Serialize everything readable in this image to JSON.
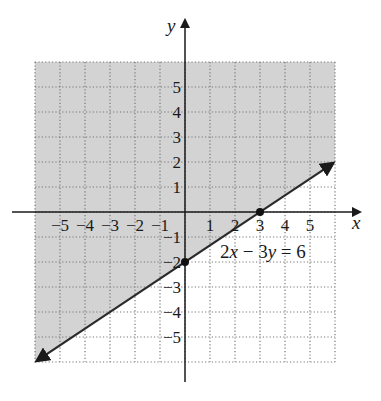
{
  "chart_data": {
    "type": "line",
    "title": "",
    "xlabel": "x",
    "ylabel": "y",
    "xlim": [
      -6,
      6
    ],
    "ylim": [
      -6,
      6
    ],
    "grid": true,
    "grid_style": "dotted",
    "x_tick_labels": [
      "−5",
      "−4",
      "−3",
      "−2",
      "−1",
      "1",
      "2",
      "3",
      "4",
      "5"
    ],
    "y_tick_labels": [
      "5",
      "4",
      "3",
      "2",
      "1",
      "−1",
      "−2",
      "−3",
      "−4",
      "−5"
    ],
    "series": [
      {
        "name": "2x − 3y = 6",
        "type": "line",
        "x": [
          -6,
          6
        ],
        "y": [
          -6,
          2
        ],
        "arrows_both_ends": true
      }
    ],
    "points": [
      {
        "x": 3,
        "y": 0,
        "label": "x-intercept"
      },
      {
        "x": 0,
        "y": -2,
        "label": "y-intercept"
      }
    ],
    "shaded_region": {
      "description": "half-plane above/left of line 2x − 3y = 6",
      "inequality": "2x − 3y < 6",
      "color": "#d3d3d3"
    },
    "annotations": [
      {
        "text_parts": [
          "2",
          "x",
          " − 3",
          "y",
          " = 6"
        ],
        "near": [
          3,
          -1.7
        ]
      }
    ]
  },
  "labels": {
    "x_axis": "x",
    "y_axis": "y",
    "equation": {
      "c1": "2",
      "v1": "x",
      "op": " − 3",
      "v2": "y",
      "rhs": " = 6"
    }
  },
  "colors": {
    "shade": "#d3d3d3",
    "axis": "#1a1a1a",
    "grid": "#777777",
    "line": "#2a2a2a"
  }
}
